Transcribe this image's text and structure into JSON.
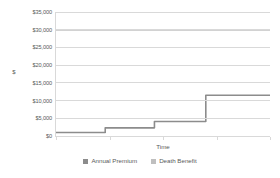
{
  "chart_data": {
    "type": "line",
    "title": "",
    "subtitle": "",
    "xlabel": "Time",
    "ylabel": "$",
    "ylim": [
      0,
      35000
    ],
    "xlim": [
      0,
      100
    ],
    "grid": true,
    "legend_position": "bottom",
    "y_ticks": [
      0,
      5000,
      10000,
      15000,
      20000,
      25000,
      30000,
      35000
    ],
    "y_tick_labels": [
      "$0",
      "$5,000",
      "$10,000",
      "$15,000",
      "$20,000",
      "$25,000",
      "$30,000",
      "$35,000"
    ],
    "x_tick_labels": [],
    "series": [
      {
        "name": "Annual Premium",
        "color": "#8c8c8c",
        "style": "step",
        "x": [
          0,
          23,
          23,
          46,
          46,
          70,
          70,
          100
        ],
        "values": [
          1000,
          1000,
          2300,
          2300,
          4100,
          4100,
          11500,
          11500
        ]
      },
      {
        "name": "Death Benefit",
        "color": "#a6a6a6",
        "style": "line",
        "x": [
          0,
          100
        ],
        "values": [
          30000,
          30000
        ]
      }
    ]
  },
  "legend": {
    "items": [
      {
        "label": "Annual Premium",
        "swatch_color": "#8c8c8c"
      },
      {
        "label": "Death Benefit",
        "swatch_color": "#bfbfbf"
      }
    ]
  },
  "axes": {
    "y_title": "$",
    "x_title": "Time"
  },
  "colors": {
    "gridline": "#d9d9d9",
    "background": "#ffffff",
    "text": "#595959",
    "series_premium": "#8c8c8c",
    "series_benefit": "#a6a6a6"
  }
}
